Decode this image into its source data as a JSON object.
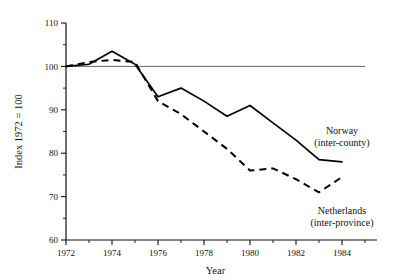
{
  "chart_data": {
    "type": "line",
    "title": "",
    "xlabel": "Year",
    "ylabel": "Index 1972 = 100",
    "xlim": [
      1972,
      1985
    ],
    "ylim": [
      60,
      110
    ],
    "grid": false,
    "legend_position": "inline-annotations",
    "reference_line": 100,
    "x_ticks_major": [
      1972,
      1974,
      1976,
      1978,
      1980,
      1982,
      1984
    ],
    "x_ticks_minor": [
      1973,
      1975,
      1977,
      1979,
      1981,
      1983,
      1985
    ],
    "x_tick_labels": [
      "1972",
      "1974",
      "1976",
      "1978",
      "1980",
      "1982",
      "1984"
    ],
    "y_ticks_major": [
      60,
      70,
      80,
      90,
      100,
      110
    ],
    "y_ticks_minor": [
      65,
      75,
      85,
      95,
      105
    ],
    "y_tick_labels": [
      "60",
      "70",
      "80",
      "90",
      "100",
      "110"
    ],
    "x": [
      1972,
      1973,
      1974,
      1975,
      1976,
      1977,
      1978,
      1979,
      1980,
      1981,
      1982,
      1983,
      1984
    ],
    "series": [
      {
        "name": "Norway",
        "sublabel": "(inter-county)",
        "style": "solid",
        "color": "#000000",
        "values": [
          100,
          100.5,
          103.5,
          100.5,
          93,
          95,
          92,
          88.5,
          91,
          87,
          83,
          78.5,
          78
        ]
      },
      {
        "name": "Netherlands",
        "sublabel": "(inter-province)",
        "style": "dashed",
        "color": "#000000",
        "values": [
          100,
          101,
          101.5,
          101,
          92,
          89,
          85,
          81,
          76,
          76.5,
          74,
          71,
          74.5
        ]
      }
    ],
    "annotations": [
      {
        "text": "Norway",
        "sub": "(inter-county)",
        "x": 1984,
        "y": 84.5
      },
      {
        "text": "Netherlands",
        "sub": "(inter-province)",
        "x": 1984,
        "y": 66
      }
    ]
  }
}
